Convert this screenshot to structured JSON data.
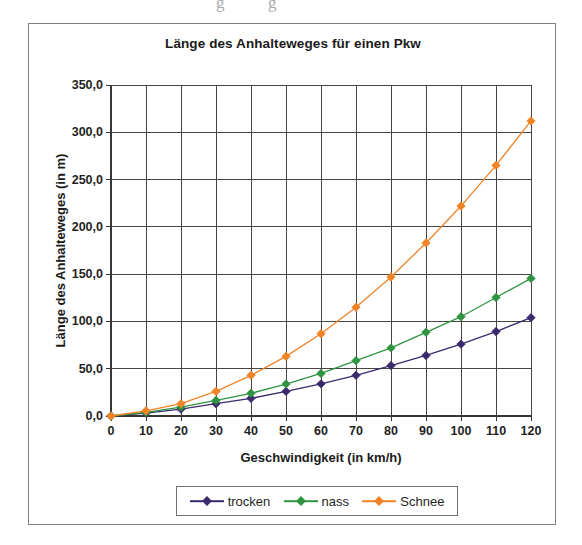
{
  "figure": {
    "title": "Länge des Anhalteweges für einen Pkw"
  },
  "scan_artifacts": [
    {
      "glyph": "g",
      "left": 216,
      "top": -6
    },
    {
      "glyph": "g",
      "left": 268,
      "top": -6
    }
  ],
  "legend": {
    "position": "bottom",
    "entries": [
      {
        "label": "trocken",
        "color": "#3b2a6b"
      },
      {
        "label": "nass",
        "color": "#2e9440"
      },
      {
        "label": "Schnee",
        "color": "#f08326"
      }
    ]
  },
  "chart_data": {
    "type": "line",
    "title": "Länge des Anhalteweges für einen Pkw",
    "xlabel": "Geschwindigkeit (in km/h)",
    "ylabel": "Länge des Anhalteweges (in m)",
    "x": [
      0,
      10,
      20,
      30,
      40,
      50,
      60,
      70,
      80,
      90,
      100,
      110,
      120
    ],
    "xlim": [
      0,
      120
    ],
    "ylim": [
      0,
      350
    ],
    "xticks": [
      0,
      10,
      20,
      30,
      40,
      50,
      60,
      70,
      80,
      90,
      100,
      110,
      120
    ],
    "xtick_labels": [
      "0",
      "10",
      "20",
      "30",
      "40",
      "50",
      "60",
      "70",
      "80",
      "90",
      "100",
      "110",
      "120"
    ],
    "yticks": [
      0,
      50,
      100,
      150,
      200,
      250,
      300,
      350
    ],
    "ytick_labels": [
      "0,0",
      "50,0",
      "100,0",
      "150,0",
      "200,0",
      "250,0",
      "300,0",
      "350,0"
    ],
    "grid": "both",
    "legend_position": "bottom",
    "marker": "diamond",
    "series": [
      {
        "name": "trocken",
        "color": "#3b2a6b",
        "values": [
          0.0,
          3.0,
          7.3,
          13.0,
          18.7,
          26.0,
          34.0,
          43.0,
          53.3,
          64.0,
          76.0,
          89.3,
          104.0
        ]
      },
      {
        "name": "nass",
        "color": "#2e9440",
        "values": [
          0.0,
          3.8,
          9.5,
          16.5,
          24.0,
          33.8,
          45.0,
          58.5,
          72.0,
          88.5,
          105.0,
          125.3,
          145.5
        ]
      },
      {
        "name": "Schnee",
        "color": "#f08326",
        "values": [
          0.0,
          5.5,
          13.0,
          26.0,
          43.0,
          63.0,
          87.0,
          115.0,
          147.0,
          183.0,
          222.0,
          265.0,
          312.0
        ]
      }
    ]
  }
}
